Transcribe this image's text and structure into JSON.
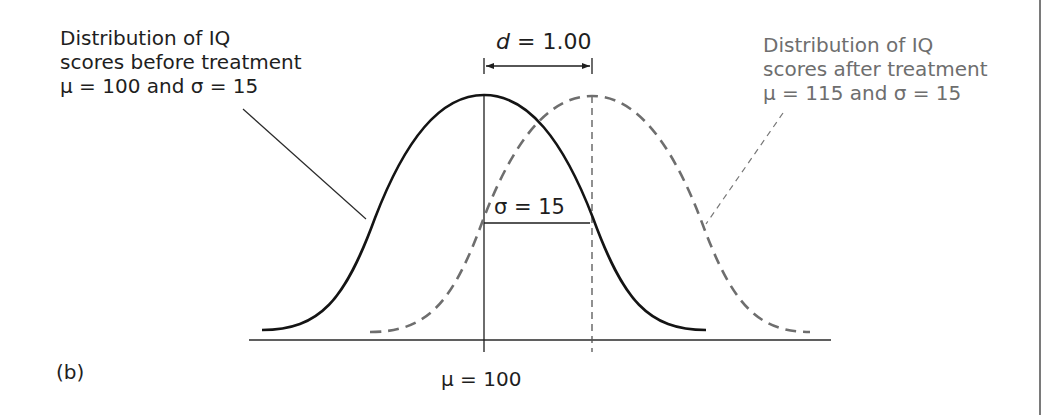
{
  "figure": {
    "panel_label": "(b)",
    "effect_size": {
      "symbol": "d",
      "text": " = 1.00"
    },
    "before": {
      "lines": [
        "Distribution of IQ",
        "scores before treatment",
        "μ = 100 and σ = 15"
      ],
      "mean": 100,
      "sd": 15,
      "color": "#1e1e1e",
      "style": "solid"
    },
    "after": {
      "lines": [
        "Distribution of IQ",
        "scores after treatment",
        "μ = 115 and σ = 15"
      ],
      "mean": 115,
      "sd": 15,
      "color": "#6e6e6e",
      "style": "dashed"
    },
    "sigma_label": "σ = 15",
    "axis_label": "μ = 100"
  }
}
